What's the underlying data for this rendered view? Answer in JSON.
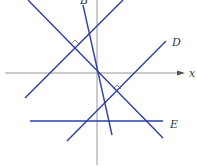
{
  "diagram": {
    "axes": {
      "x_label": "x",
      "color": "#8a8a8a"
    },
    "line_color": "#2b3fa8",
    "lines": [
      {
        "id": "B",
        "label": "B",
        "from": [
          83,
          5
        ],
        "to": [
          112,
          135
        ]
      },
      {
        "id": "through-origin",
        "label": "",
        "from": [
          28,
          0
        ],
        "to": [
          163,
          138
        ]
      },
      {
        "id": "parallel-upper",
        "label": "",
        "from": [
          25,
          98
        ],
        "to": [
          123,
          0
        ]
      },
      {
        "id": "D",
        "label": "D",
        "from": [
          67,
          141
        ],
        "to": [
          166,
          41
        ]
      },
      {
        "id": "E",
        "label": "E",
        "from": [
          30,
          121
        ],
        "to": [
          163,
          121
        ]
      }
    ],
    "right_angle_markers": [
      {
        "at": [
          75,
          42
        ]
      },
      {
        "at": [
          117,
          87
        ]
      }
    ],
    "labels": {
      "B": "B",
      "D": "D",
      "E": "E",
      "x": "x"
    }
  }
}
